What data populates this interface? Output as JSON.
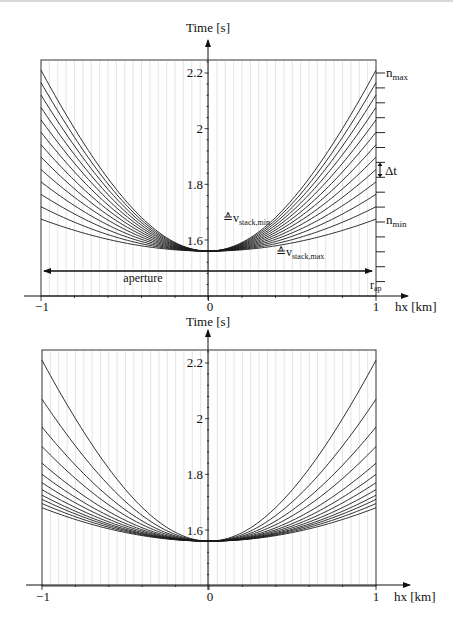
{
  "chart_data": [
    {
      "type": "line",
      "title": "",
      "xlabel": "hx [km]",
      "ylabel": "Time [s]",
      "xlim": [
        -1,
        1
      ],
      "ylim": [
        1.44,
        2.25
      ],
      "x_ticks": [
        "-1",
        "0",
        "1"
      ],
      "y_ticks": [
        "1.6",
        "1.8",
        "2",
        "2.2"
      ],
      "grid": "vertical, fine",
      "apex_time": 1.56,
      "curve_count": 13,
      "curve_family": "hyperbolic traveltime curves t(hx) = sqrt(t0^2 + 4hx^2/v^2), equal time spacing Δt at aperture edge",
      "series_endpoint_times_at_abs_hx_1": [
        2.21,
        2.155,
        2.1,
        2.045,
        1.99,
        1.935,
        1.88,
        1.825,
        1.775,
        1.72,
        1.68
      ],
      "annotations": {
        "n_max": "n_max",
        "n_min": "n_min",
        "delta_t": "Δt",
        "v_stack_min": "≙v_stack,min",
        "v_stack_max": "≙v_stack,max",
        "aperture": "aperture",
        "r_ap": "r_ap"
      },
      "right_tick_count": 15
    },
    {
      "type": "line",
      "title": "",
      "xlabel": "hx [km]",
      "ylabel": "Time [s]",
      "xlim": [
        -1,
        1
      ],
      "ylim": [
        1.44,
        2.25
      ],
      "x_ticks": [
        "-1",
        "0",
        "1"
      ],
      "y_ticks": [
        "1.6",
        "1.8",
        "2",
        "2.2"
      ],
      "grid": "vertical, fine",
      "apex_time": 1.56,
      "curve_count": 12,
      "curve_family": "hyperbolic traveltime curves with equal slowness spacing (non-uniform time spacing at aperture edge)",
      "series_endpoint_times_at_abs_hx_1": [
        2.21,
        2.07,
        1.97,
        1.9,
        1.84,
        1.8,
        1.77,
        1.745,
        1.725,
        1.71,
        1.695,
        1.68
      ]
    }
  ],
  "top": {
    "ylabel": "Time [s]",
    "xlabel": "hx [km]",
    "x_tick_labels": [
      "−1",
      "0",
      "1"
    ],
    "y_tick_labels": [
      "2.2",
      "2",
      "1.8",
      "1.6"
    ],
    "n_max": "n",
    "n_max_sub": "max",
    "n_min": "n",
    "n_min_sub": "min",
    "delta_t": "Δt",
    "v_min_prefix": "≙v",
    "v_min_sub": "stack,min",
    "v_max_prefix": "≙v",
    "v_max_sub": "stack,max",
    "aperture": "aperture",
    "r_ap": "r",
    "r_ap_sub": "ap"
  },
  "bottom": {
    "ylabel": "Time [s]",
    "xlabel": "hx [km]",
    "x_tick_labels": [
      "−1",
      "0",
      "1"
    ],
    "y_tick_labels": [
      "2.2",
      "2",
      "1.8",
      "1.6"
    ]
  }
}
